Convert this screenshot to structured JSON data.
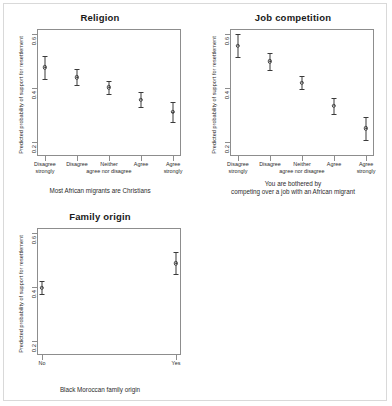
{
  "figure": {
    "ylabel": "Predicted probability of support for resettlement",
    "ytick_labels": [
      "0.2",
      "0.4",
      "0.6"
    ],
    "ylim": [
      0.15,
      0.62
    ],
    "yticks": [
      0.2,
      0.4,
      0.6
    ]
  },
  "chart_data": [
    {
      "type": "scatter",
      "id": "religion",
      "title": "Religion",
      "xlabel": "Most African migrants are Christians",
      "xlabel_line2": "",
      "ylabel": "Predicted probability of support for resettlement",
      "ylim": [
        0.15,
        0.62
      ],
      "yticks": [
        0.2,
        0.4,
        0.6
      ],
      "grid": false,
      "legend": "none",
      "categories": [
        "Disagree strongly",
        "Disagree",
        "Neither agree nor disagree",
        "Agree",
        "Agree strongly"
      ],
      "category_lines": [
        [
          "Disagree",
          "strongly"
        ],
        [
          "Disagree",
          ""
        ],
        [
          "Neither",
          "agree nor disagree"
        ],
        [
          "Agree",
          ""
        ],
        [
          "Agree",
          "strongly"
        ]
      ],
      "values": [
        0.478,
        0.441,
        0.404,
        0.358,
        0.313
      ],
      "ci_low": [
        0.436,
        0.411,
        0.381,
        0.33,
        0.277
      ],
      "ci_high": [
        0.521,
        0.473,
        0.428,
        0.387,
        0.349
      ]
    },
    {
      "type": "scatter",
      "id": "job-competition",
      "title": "Job competition",
      "xlabel": "You are bothered by",
      "xlabel_line2": "competing over a job with an African migrant",
      "ylabel": "Predicted probability of support for resettlement",
      "ylim": [
        0.15,
        0.62
      ],
      "yticks": [
        0.2,
        0.4,
        0.6
      ],
      "grid": false,
      "legend": "none",
      "categories": [
        "Disagree strongly",
        "Disagree",
        "Neither agree nor disagree",
        "Agree",
        "Agree strongly"
      ],
      "category_lines": [
        [
          "Disagree",
          "strongly"
        ],
        [
          "Disagree",
          ""
        ],
        [
          "Neither",
          "agree nor disagree"
        ],
        [
          "Agree",
          ""
        ],
        [
          "Agree",
          "strongly"
        ]
      ],
      "values": [
        0.558,
        0.5,
        0.421,
        0.336,
        0.252
      ],
      "ci_low": [
        0.518,
        0.47,
        0.397,
        0.306,
        0.211
      ],
      "ci_high": [
        0.601,
        0.531,
        0.447,
        0.366,
        0.293
      ]
    },
    {
      "type": "scatter",
      "id": "family-origin",
      "title": "Family origin",
      "xlabel": "Black Moroccan family origin",
      "xlabel_line2": "",
      "ylabel": "Predicted probability of support for resettlement",
      "ylim": [
        0.15,
        0.62
      ],
      "yticks": [
        0.2,
        0.4,
        0.6
      ],
      "grid": false,
      "legend": "none",
      "categories": [
        "No",
        "Yes"
      ],
      "category_lines": [
        [
          "No",
          ""
        ],
        [
          "Yes",
          ""
        ]
      ],
      "values": [
        0.399,
        0.489
      ],
      "ci_low": [
        0.374,
        0.449
      ],
      "ci_high": [
        0.424,
        0.53
      ]
    }
  ]
}
